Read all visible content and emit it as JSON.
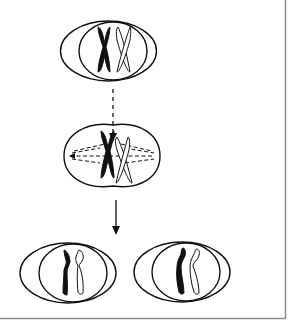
{
  "diagram": {
    "type": "cell-division-schematic",
    "stages": [
      {
        "id": "parent-cell",
        "chromosomes": [
          "black-replicated",
          "white-replicated"
        ]
      },
      {
        "id": "dividing-cell",
        "chromosomes": [
          "black-replicated",
          "white-replicated"
        ],
        "spindle": true
      },
      {
        "id": "daughter-cell-left",
        "chromosomes": [
          "black-chromatid",
          "white-chromatid"
        ]
      },
      {
        "id": "daughter-cell-right",
        "chromosomes": [
          "black-chromatid",
          "white-chromatid"
        ]
      }
    ],
    "arrows": [
      {
        "id": "arrow-1",
        "style": "dashed"
      },
      {
        "id": "arrow-2",
        "style": "solid"
      }
    ],
    "colors": {
      "line": "#111111",
      "fill_dark": "#111111",
      "fill_light": "#ffffff",
      "border": "#888888",
      "background": "#ffffff"
    }
  }
}
